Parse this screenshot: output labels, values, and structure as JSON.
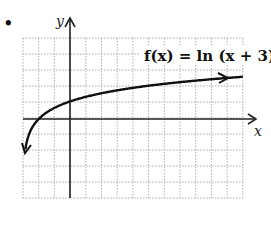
{
  "bullet": "•",
  "chart_data": {
    "type": "line",
    "title": "f(x) = ln (x + 3)",
    "xlabel": "x",
    "ylabel": "y",
    "xlim": [
      -3,
      11
    ],
    "ylim": [
      -5,
      5
    ],
    "grid": true,
    "series": [
      {
        "name": "f(x) = ln (x + 3)",
        "x": [
          -2.9,
          -2.5,
          -2,
          -1,
          0,
          1,
          2,
          4,
          6,
          8,
          11
        ],
        "y": [
          -2.3,
          -0.69,
          0,
          0.69,
          1.1,
          1.39,
          1.61,
          1.95,
          2.2,
          2.4,
          2.64
        ]
      }
    ],
    "annotations": [
      "f(x) = ln (x + 3)"
    ]
  },
  "labels": {
    "x_axis": "x",
    "y_axis": "y",
    "function": "f(x) = ln (x + 3)"
  }
}
